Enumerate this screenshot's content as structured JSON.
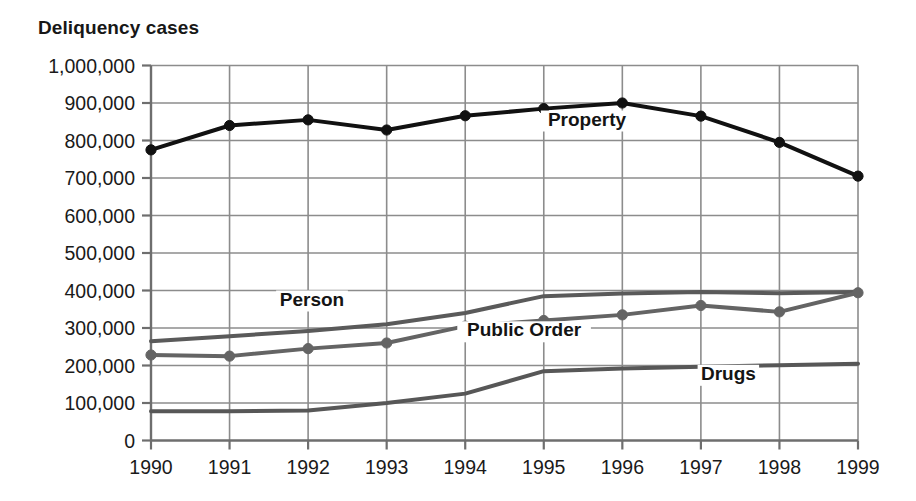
{
  "chart": {
    "title": "Deliquency cases"
  },
  "chart_data": {
    "type": "line",
    "title": "Deliquency cases",
    "xlabel": "",
    "ylabel": "Deliquency cases",
    "x": [
      1990,
      1991,
      1992,
      1993,
      1994,
      1995,
      1996,
      1997,
      1998,
      1999
    ],
    "xtick_labels": [
      "1990",
      "1991",
      "1992",
      "1993",
      "1994",
      "1995",
      "1996",
      "1997",
      "1998",
      "1999"
    ],
    "ytick_labels": [
      "0",
      "100,000",
      "200,000",
      "300,000",
      "400,000",
      "500,000",
      "600,000",
      "700,000",
      "800,000",
      "900,000",
      "1,000,000"
    ],
    "ytick_values": [
      0,
      100000,
      200000,
      300000,
      400000,
      500000,
      600000,
      700000,
      800000,
      900000,
      1000000
    ],
    "ylim": [
      0,
      1000000
    ],
    "grid": true,
    "legend_position": "inline-annotations",
    "series": [
      {
        "name": "Property",
        "label_text": "Property",
        "color": "#111111",
        "markers": "circle",
        "line_width": 4,
        "values": [
          775000,
          840000,
          855000,
          828000,
          866000,
          885000,
          900000,
          865000,
          795000,
          705000
        ]
      },
      {
        "name": "Person",
        "label_text": "Person",
        "color": "#5a5a5a",
        "markers": "none",
        "line_width": 4,
        "values": [
          265000,
          278000,
          292000,
          310000,
          340000,
          385000,
          392000,
          396000,
          393000,
          396000
        ]
      },
      {
        "name": "Public Order",
        "label_text": "Public Order",
        "color": "#646464",
        "markers": "circle",
        "line_width": 4,
        "values": [
          228000,
          225000,
          245000,
          260000,
          305000,
          320000,
          335000,
          360000,
          343000,
          394000
        ]
      },
      {
        "name": "Drugs",
        "label_text": "Drugs",
        "color": "#575757",
        "markers": "none",
        "line_width": 4,
        "values": [
          78000,
          78000,
          80000,
          100000,
          125000,
          185000,
          192000,
          197000,
          201000,
          205000
        ]
      }
    ],
    "annotations": [
      {
        "text": "Property",
        "x": 1995.55,
        "y": 840000
      },
      {
        "text": "Person",
        "x": 1992.05,
        "y": 360000
      },
      {
        "text": "Public Order",
        "x": 1994.75,
        "y": 278000
      },
      {
        "text": "Drugs",
        "x": 1997.35,
        "y": 162000
      }
    ]
  }
}
